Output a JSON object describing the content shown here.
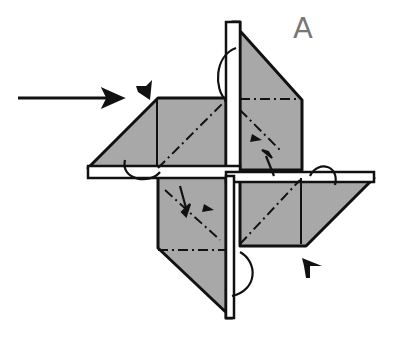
{
  "diagram": {
    "type": "origami-step",
    "step_label": "A",
    "colors": {
      "paper": "#a8a8a8",
      "outline": "#111111",
      "label": "#777777",
      "background": "#ffffff"
    },
    "annotations": [
      {
        "kind": "insertion-arrow",
        "direction": "right"
      },
      {
        "kind": "corner-marker",
        "position": "upper-left"
      },
      {
        "kind": "corner-marker",
        "position": "lower-right"
      },
      {
        "kind": "fold-arrows",
        "count": 4
      }
    ]
  }
}
